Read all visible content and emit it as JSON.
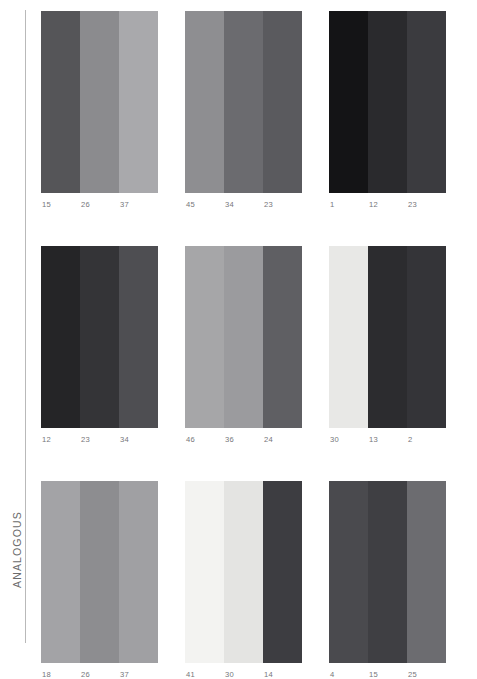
{
  "section": {
    "label": "ANALOGOUS"
  },
  "palettes": [
    {
      "name": "palette-1",
      "codes": [
        "15",
        "26",
        "37"
      ],
      "colors": [
        "#555558",
        "#8b8b8e",
        "#a9a9ac"
      ]
    },
    {
      "name": "palette-2",
      "codes": [
        "45",
        "34",
        "23"
      ],
      "colors": [
        "#8e8e91",
        "#6b6b6f",
        "#5a5a5e"
      ]
    },
    {
      "name": "palette-3",
      "codes": [
        "1",
        "12",
        "23"
      ],
      "colors": [
        "#141416",
        "#2a2a2d",
        "#3b3b3f"
      ]
    },
    {
      "name": "palette-4",
      "codes": [
        "12",
        "23",
        "34"
      ],
      "colors": [
        "#252527",
        "#343437",
        "#4e4e52"
      ]
    },
    {
      "name": "palette-5",
      "codes": [
        "46",
        "36",
        "24"
      ],
      "colors": [
        "#a6a6a8",
        "#9b9b9e",
        "#5f5f63"
      ]
    },
    {
      "name": "palette-6",
      "codes": [
        "30",
        "13",
        "2"
      ],
      "colors": [
        "#e8e8e6",
        "#2c2c2f",
        "#343438"
      ]
    },
    {
      "name": "palette-7",
      "codes": [
        "18",
        "26",
        "37"
      ],
      "colors": [
        "#a3a3a6",
        "#8d8d90",
        "#a0a0a3"
      ]
    },
    {
      "name": "palette-8",
      "codes": [
        "41",
        "30",
        "14"
      ],
      "colors": [
        "#f3f3f1",
        "#e4e4e2",
        "#3d3d41"
      ]
    },
    {
      "name": "palette-9",
      "codes": [
        "4",
        "15",
        "25"
      ],
      "colors": [
        "#4a4a4e",
        "#3f3f43",
        "#6c6c70"
      ]
    }
  ]
}
